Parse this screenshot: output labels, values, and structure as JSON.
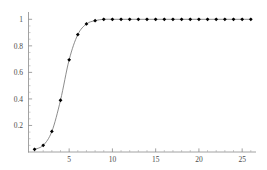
{
  "chart_data": {
    "type": "line",
    "title": "",
    "subtitle": "",
    "xlabel": "",
    "ylabel": "",
    "xlim": [
      0.3,
      26.6
    ],
    "ylim": [
      0.0,
      1.04
    ],
    "grid": false,
    "legend": null,
    "marker": "point",
    "marker_color": "#000000",
    "line_color": "#6e6e6e",
    "axis_color": "#8a8a8a",
    "label_color": "#4a4a4a",
    "background": "#ffffff",
    "x_ticks_major": [
      5,
      10,
      15,
      20,
      25
    ],
    "x_tick_labels": [
      "5",
      "10",
      "15",
      "20",
      "25"
    ],
    "x_ticks_minor_step": 1,
    "y_ticks_major": [
      0.2,
      0.4,
      0.6,
      0.8,
      1
    ],
    "y_tick_labels": [
      "0.2",
      "0.4",
      "0.6",
      "0.8",
      "1"
    ],
    "y_ticks_minor_step": 0.05,
    "x": [
      1,
      2,
      3,
      4,
      5,
      6,
      7,
      8,
      9,
      10,
      11,
      12,
      13,
      14,
      15,
      16,
      17,
      18,
      19,
      20,
      21,
      22,
      23,
      24,
      25,
      26
    ],
    "y": [
      0.02,
      0.05,
      0.155,
      0.39,
      0.695,
      0.885,
      0.965,
      0.99,
      1.0,
      1.0,
      1.0,
      1.0,
      1.0,
      1.0,
      1.0,
      1.0,
      1.0,
      1.0,
      1.0,
      1.0,
      1.0,
      1.0,
      1.0,
      1.0,
      1.0,
      1.0
    ],
    "series": [
      {
        "name": "cumulative probability",
        "values": [
          0.02,
          0.05,
          0.155,
          0.39,
          0.695,
          0.885,
          0.965,
          0.99,
          1.0,
          1.0,
          1.0,
          1.0,
          1.0,
          1.0,
          1.0,
          1.0,
          1.0,
          1.0,
          1.0,
          1.0,
          1.0,
          1.0,
          1.0,
          1.0,
          1.0,
          1.0
        ]
      }
    ]
  }
}
